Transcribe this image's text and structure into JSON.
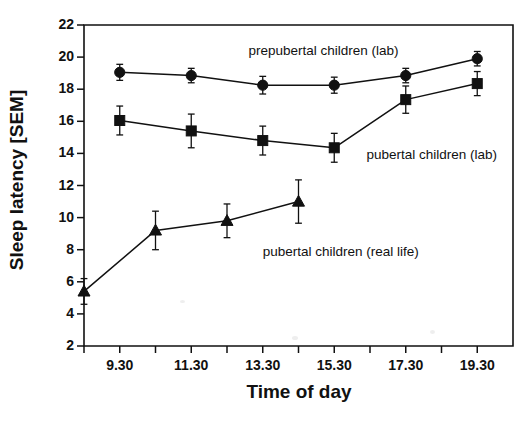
{
  "figure": {
    "width": 531,
    "height": 431,
    "background": "#ffffff",
    "ink_color": "#111111"
  },
  "chart_data": {
    "type": "line",
    "title": "",
    "xlabel": "Time of day",
    "ylabel": "Sleep latency [SEM]",
    "xlim": [
      8.5,
      20.5
    ],
    "ylim": [
      2,
      22
    ],
    "yticks": [
      2,
      4,
      6,
      8,
      10,
      12,
      14,
      16,
      18,
      20,
      22
    ],
    "ytick_labels": [
      "2",
      "4",
      "6",
      "8",
      "10",
      "12",
      "14",
      "16",
      "18",
      "20",
      "22"
    ],
    "x_tick_positions": [
      8.5,
      9.5,
      10.5,
      11.5,
      12.5,
      13.5,
      14.5,
      15.5,
      16.5,
      17.5,
      18.5,
      19.5
    ],
    "xtick_labels": [
      "9.30",
      "11.30",
      "13.30",
      "15.30",
      "17.30",
      "19.30"
    ],
    "xtick_label_positions": [
      9.5,
      11.5,
      13.5,
      15.5,
      17.5,
      19.5
    ],
    "grid": false,
    "legend_position": "inline-annotations",
    "error_bar_note": "SEM",
    "series": [
      {
        "name": "prepubertal children (lab)",
        "marker": "circle",
        "x": [
          9.5,
          11.5,
          13.5,
          15.5,
          17.5,
          19.5
        ],
        "values": [
          19.05,
          18.85,
          18.25,
          18.25,
          18.85,
          19.9
        ],
        "errors": [
          0.5,
          0.45,
          0.55,
          0.5,
          0.45,
          0.45
        ],
        "label_x": 13.1,
        "label_y": 20.4
      },
      {
        "name": "pubertal children (lab)",
        "marker": "square",
        "x": [
          9.5,
          11.5,
          13.5,
          15.5,
          17.5,
          19.5
        ],
        "values": [
          16.05,
          15.4,
          14.8,
          14.35,
          17.35,
          18.35
        ],
        "errors": [
          0.9,
          1.05,
          0.9,
          0.9,
          0.85,
          0.75
        ],
        "label_x": 16.4,
        "label_y": 13.9
      },
      {
        "name": "pubertal children (real life)",
        "marker": "triangle",
        "x": [
          8.5,
          10.5,
          12.5,
          14.5
        ],
        "values": [
          5.4,
          9.2,
          9.8,
          11.0
        ],
        "errors": [
          0.8,
          1.2,
          1.05,
          1.35
        ],
        "label_x": 13.5,
        "label_y": 7.85
      }
    ]
  },
  "annotations": {
    "series_labels": [
      "prepubertal children (lab)",
      "pubertal children (lab)",
      "pubertal children (real life)"
    ]
  }
}
